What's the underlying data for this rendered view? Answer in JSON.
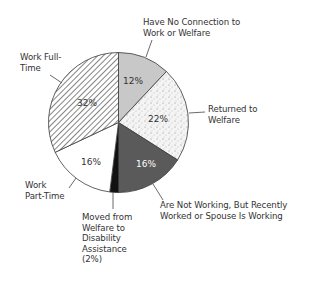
{
  "chart_data": {
    "type": "pie",
    "title": "",
    "start_angle_deg": 0,
    "direction": "clockwise",
    "slices": [
      {
        "label": "Have No Connection to Work or Welfare",
        "value": 12,
        "display": "12%",
        "fill": "#c8c8c8",
        "pattern": "solid-light-gray"
      },
      {
        "label": "Returned to Welfare",
        "value": 22,
        "display": "22%",
        "fill": "#f2f2f2",
        "pattern": "stipple"
      },
      {
        "label": "Are Not Working, But Recently Worked or Spouse Is Working",
        "value": 16,
        "display": "16%",
        "fill": "#5a5a5a",
        "pattern": "solid-dark-gray"
      },
      {
        "label": "Moved from Welfare to Disability Assistance",
        "value": 2,
        "display": "(2%)",
        "fill": "#111111",
        "pattern": "solid-black"
      },
      {
        "label": "Work Part-Time",
        "value": 16,
        "display": "16%",
        "fill": "#ffffff",
        "pattern": "solid-white"
      },
      {
        "label": "Work Full-Time",
        "value": 32,
        "display": "32%",
        "fill": "#ffffff",
        "pattern": "diagonal-hatch"
      }
    ],
    "legend": "none (callout labels with leader lines)"
  },
  "labels": {
    "no_connection": [
      "Have No Connection to",
      "Work or Welfare"
    ],
    "returned": [
      "Returned to",
      "Welfare"
    ],
    "not_working": [
      "Are Not Working, But Recently",
      "Worked or Spouse Is Working"
    ],
    "disability": [
      "Moved from",
      "Welfare to",
      "Disability",
      "Assistance",
      "(2%)"
    ],
    "part_time": [
      "Work",
      "Part-Time"
    ],
    "full_time": [
      "Work Full-",
      "Time"
    ]
  },
  "slice_pcts": {
    "no_connection": "12%",
    "returned": "22%",
    "not_working": "16%",
    "part_time": "16%",
    "full_time": "32%"
  }
}
